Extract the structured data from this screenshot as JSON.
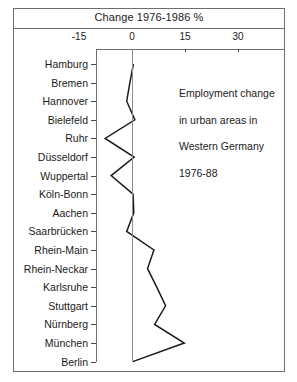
{
  "chart_data": {
    "type": "line",
    "orientation": "horizontal",
    "title": "Change 1976-1986 %",
    "xlabel": "Change 1976-1986 %",
    "ylabel": "",
    "xlim": [
      -15,
      30
    ],
    "xticks": [
      -15,
      0,
      15,
      30
    ],
    "xtick_labels": [
      "-15",
      "0",
      "15",
      "30"
    ],
    "grid": false,
    "zero_reference_line": true,
    "legend": null,
    "annotations": [
      {
        "text": "Employment change\nin urban areas in\nWestern Germany\n1976-88",
        "position": "upper-right"
      }
    ],
    "categories": [
      "Hamburg",
      "Bremen",
      "Hannover",
      "Bielefeld",
      "Ruhr",
      "Düsseldorf",
      "Wuppertal",
      "Köln-Bonn",
      "Aachen",
      "Saarbrücken",
      "Rhein-Main",
      "Rhein-Neckar",
      "Karlsruhe",
      "Stuttgart",
      "Nürnberg",
      "München",
      "Berlin"
    ],
    "values": [
      0.4,
      -0.6,
      -1.5,
      0.8,
      -7.6,
      0.6,
      -5.9,
      0.3,
      0.5,
      -1.5,
      6.2,
      4.4,
      7.0,
      9.5,
      6.4,
      14.8,
      0.2
    ],
    "series": [
      {
        "name": "Employment change 1976-1986 %",
        "values": [
          0.4,
          -0.6,
          -1.5,
          0.8,
          -7.6,
          0.6,
          -5.9,
          0.3,
          0.5,
          -1.5,
          6.2,
          4.4,
          7.0,
          9.5,
          6.4,
          14.8,
          0.2
        ]
      }
    ],
    "line_color": "#1a1a1a",
    "axis_color": "#6e6e6e"
  },
  "figure": {
    "border_color": "#6e6e6e",
    "background": "#ffffff"
  },
  "annotation_block": {
    "line1": "Employment change",
    "line2": "in urban areas in",
    "line3": "Western Germany",
    "line4": "1976-88"
  }
}
